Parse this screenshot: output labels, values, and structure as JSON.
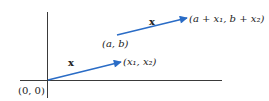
{
  "diagram": {
    "colors": {
      "axis": "#3a3a3a",
      "vector": "#2a6cc6",
      "text": "#222222"
    },
    "axes": {
      "origin_label": "(0, 0)"
    },
    "vectors": [
      {
        "name": "x-from-origin",
        "label": "x",
        "start_label": "",
        "end_label": "(x₁, x₂)"
      },
      {
        "name": "x-translated",
        "label": "x",
        "start_label": "(a, b)",
        "end_label": "(a + x₁, b + x₂)"
      }
    ]
  }
}
